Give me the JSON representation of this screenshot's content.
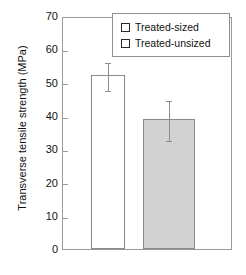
{
  "chart_data": {
    "type": "bar",
    "title": "",
    "xlabel": "",
    "ylabel": "Transverse tensile strength (MPa)",
    "ylim": [
      0,
      70
    ],
    "yticks": [
      70,
      60,
      50,
      40,
      30,
      20,
      10,
      0
    ],
    "ytick_labels": [
      "70",
      "60",
      "50",
      "40",
      "30",
      "20",
      "10",
      "0"
    ],
    "grid": false,
    "legend_position": "top-right",
    "categories": [
      "Treated-sized",
      "Treated-unsized"
    ],
    "values": [
      52.3,
      39.0
    ],
    "errors_upper": [
      56.5,
      45.0
    ],
    "errors_lower": [
      48.2,
      33.0
    ],
    "bars": [
      {
        "label": "Treated-sized",
        "value": 52.3,
        "error_upper": 56.5,
        "error_lower": 48.2,
        "fill": "#ffffff",
        "edge": "#8a8a8a"
      },
      {
        "label": "Treated-unsized",
        "value": 39.0,
        "error_upper": 45.0,
        "error_lower": 33.0,
        "fill": "#d2d2d2",
        "edge": "#8a8a8a"
      }
    ]
  },
  "legend": {
    "items": [
      {
        "label": "Treated-sized",
        "swatch_color": "#ffffff"
      },
      {
        "label": "Treated-unsized",
        "swatch_color": "#ffffff"
      }
    ]
  },
  "axis": {
    "ylabel": "Transverse tensile strength (MPa)",
    "ytick_labels": [
      "70",
      "60",
      "50",
      "40",
      "30",
      "20",
      "10",
      "0"
    ]
  },
  "colors": {
    "frame": "#9a9a9a",
    "bar_edge": "#8a8a8a",
    "bar_fill_gray": "#d2d2d2",
    "bar_fill_white": "#ffffff",
    "error": "#8d8d8d",
    "text": "#111111"
  }
}
